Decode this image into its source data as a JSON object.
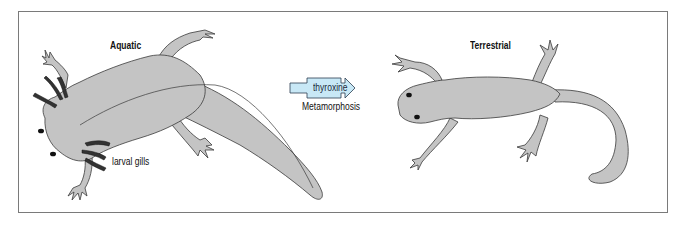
{
  "diagram": {
    "stages": [
      {
        "id": "aquatic",
        "label": "Aquatic"
      },
      {
        "id": "terrestrial",
        "label": "Terrestrial"
      }
    ],
    "annotations": {
      "gills": "larval gills"
    },
    "transition": {
      "agent": "thyroxine",
      "process": "Metamorphosis"
    },
    "colors": {
      "body_fill": "#c4c4c4",
      "outline": "#3a3a3a",
      "gill_fill": "#333333",
      "arrow_fill": "#c8e8f6",
      "arrow_stroke": "#2c3e50",
      "frame": "#7a7a7a"
    }
  }
}
